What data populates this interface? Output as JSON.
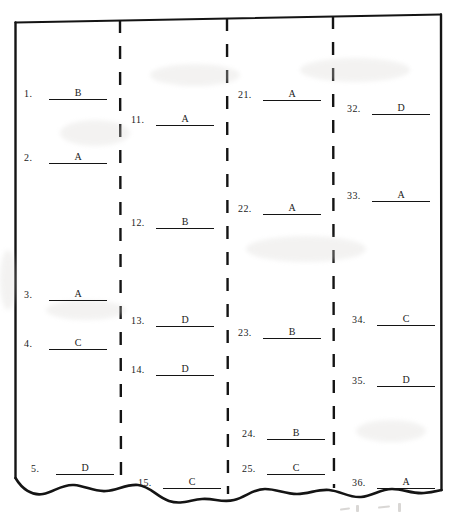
{
  "document": {
    "kind": "scanned-answer-key-fragment",
    "paper_color": "#ffffff",
    "ink_color": "#141414",
    "bottom_edge": "torn",
    "column_separator_style": "dashed",
    "outer_border_style": "solid"
  },
  "columns": [
    {
      "id": "column-1",
      "entries": [
        {
          "number": "1.",
          "answer": "B"
        },
        {
          "number": "2.",
          "answer": "A"
        },
        {
          "number": "3.",
          "answer": "A"
        },
        {
          "number": "4.",
          "answer": "C"
        },
        {
          "number": "5.",
          "answer": "D"
        }
      ]
    },
    {
      "id": "column-2",
      "entries": [
        {
          "number": "11.",
          "answer": "A"
        },
        {
          "number": "12.",
          "answer": "B"
        },
        {
          "number": "13.",
          "answer": "D"
        },
        {
          "number": "14.",
          "answer": "D"
        },
        {
          "number": "15.",
          "answer": "C"
        }
      ]
    },
    {
      "id": "column-3",
      "entries": [
        {
          "number": "21.",
          "answer": "A"
        },
        {
          "number": "22.",
          "answer": "A"
        },
        {
          "number": "23.",
          "answer": "B"
        },
        {
          "number": "24.",
          "answer": "B"
        },
        {
          "number": "25.",
          "answer": "C"
        }
      ]
    },
    {
      "id": "column-4",
      "entries": [
        {
          "number": "32.",
          "answer": "D"
        },
        {
          "number": "33.",
          "answer": "A"
        },
        {
          "number": "34.",
          "answer": "C"
        },
        {
          "number": "35.",
          "answer": "D"
        },
        {
          "number": "36.",
          "answer": "A"
        }
      ]
    }
  ],
  "layout": {
    "entry_positions": {
      "column-1": [
        {
          "x": 24,
          "y": 88
        },
        {
          "x": 24,
          "y": 152
        },
        {
          "x": 24,
          "y": 289
        },
        {
          "x": 24,
          "y": 338
        },
        {
          "x": 31,
          "y": 463
        }
      ],
      "column-2": [
        {
          "x": 131,
          "y": 114
        },
        {
          "x": 131,
          "y": 217
        },
        {
          "x": 131,
          "y": 315
        },
        {
          "x": 131,
          "y": 364
        },
        {
          "x": 138,
          "y": 477
        }
      ],
      "column-3": [
        {
          "x": 238,
          "y": 89
        },
        {
          "x": 238,
          "y": 203
        },
        {
          "x": 238,
          "y": 327
        },
        {
          "x": 242,
          "y": 428
        },
        {
          "x": 242,
          "y": 463
        }
      ],
      "column-4": [
        {
          "x": 347,
          "y": 103
        },
        {
          "x": 347,
          "y": 190
        },
        {
          "x": 352,
          "y": 314
        },
        {
          "x": 352,
          "y": 375
        },
        {
          "x": 352,
          "y": 477
        }
      ]
    }
  }
}
